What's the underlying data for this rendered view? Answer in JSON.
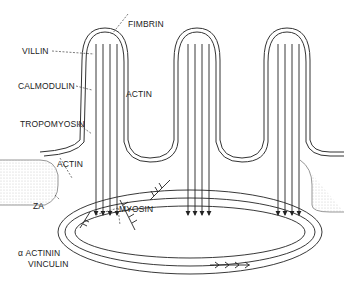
{
  "diagram": {
    "labels": {
      "fimbrin": "FIMBRIN",
      "villin": "VILLIN",
      "calmodulin": "CALMODULIN",
      "actin_top": "ACTIN",
      "tropomyosin": "TROPOMYOSIN",
      "actin_left": "ACTIN",
      "za": "ZA",
      "myosin": "MYOSIN",
      "alpha_actinin": "α ACTININ",
      "vinculin": "VINCULIN"
    },
    "colors": {
      "line": "#222222",
      "stipple": "#bdbdbd",
      "background": "#ffffff"
    }
  }
}
